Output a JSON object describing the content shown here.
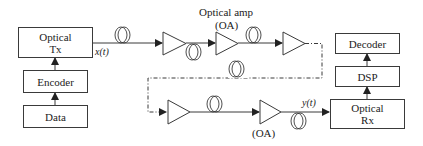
{
  "diagram": {
    "type": "optical-communication-link",
    "blocks": {
      "optical_tx": {
        "line1": "Optical",
        "line2": "Tx"
      },
      "encoder": {
        "label": "Encoder"
      },
      "data": {
        "label": "Data"
      },
      "optical_rx": {
        "line1": "Optical",
        "line2": "Rx"
      },
      "dsp": {
        "label": "DSP"
      },
      "decoder": {
        "label": "Decoder"
      }
    },
    "labels": {
      "amp_top_line1": "Optical amp",
      "amp_top_line2": "(OA)",
      "amp_bottom": "(OA)",
      "input_signal": "x(t)",
      "output_signal": "y(t)"
    },
    "colors": {
      "stroke": "#3a3a3a",
      "background": "#ffffff"
    },
    "amplifier_count": 5,
    "fiber_spool_count": 6
  }
}
